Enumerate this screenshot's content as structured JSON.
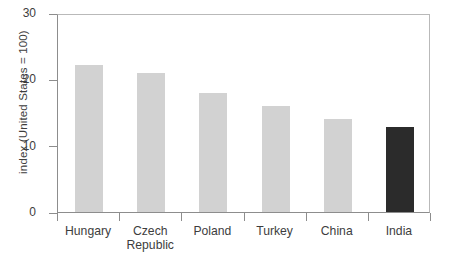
{
  "chart_data": {
    "type": "bar",
    "title": "",
    "xlabel": "",
    "ylabel": "index (United States = 100)",
    "categories": [
      "Hungary",
      "Czech\nRepublic",
      "Poland",
      "Turkey",
      "China",
      "India"
    ],
    "values": [
      22.2,
      21.0,
      18.0,
      16.0,
      14.0,
      12.8
    ],
    "ylim": [
      0,
      30
    ],
    "yticks": [
      0,
      10,
      20,
      30
    ],
    "ytick_labels": [
      "0",
      "10",
      "20",
      "30"
    ],
    "grid": false,
    "legend": "none",
    "bar_colors": [
      "#d2d2d2",
      "#d2d2d2",
      "#d2d2d2",
      "#d2d2d2",
      "#d2d2d2",
      "#2b2b2b"
    ],
    "highlight_category": "India",
    "series": [
      {
        "name": "index",
        "values": [
          22.2,
          21.0,
          18.0,
          16.0,
          14.0,
          12.8
        ]
      }
    ]
  },
  "colors": {
    "bar_default": "#d2d2d2",
    "bar_highlight": "#2b2b2b",
    "axis": "#8d8d8d",
    "frame": "#b9b9b9",
    "text": "#3d3d3d",
    "background": "#ffffff"
  }
}
